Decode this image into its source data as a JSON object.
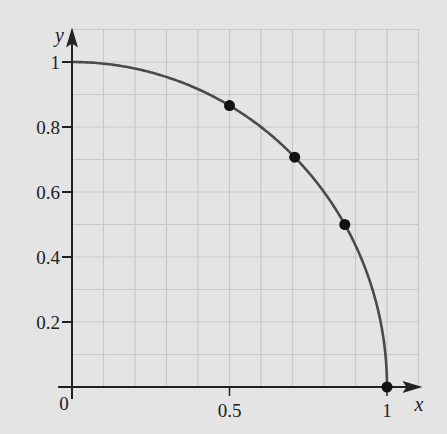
{
  "chart_data": {
    "type": "line",
    "title": "",
    "xlabel": "x",
    "ylabel": "y",
    "xlim": [
      0,
      1.1
    ],
    "ylim": [
      0,
      1.1
    ],
    "grid": true,
    "grid_step": 0.1,
    "x_ticks": [
      {
        "value": 0,
        "label": "0"
      },
      {
        "value": 0.5,
        "label": "0.5"
      },
      {
        "value": 1,
        "label": "1"
      }
    ],
    "y_ticks": [
      {
        "value": 0.2,
        "label": "0.2"
      },
      {
        "value": 0.4,
        "label": "0.4"
      },
      {
        "value": 0.6,
        "label": "0.6"
      },
      {
        "value": 0.8,
        "label": "0.8"
      },
      {
        "value": 1,
        "label": "1"
      }
    ],
    "series": [
      {
        "name": "quarter circle y = sqrt(1 - x^2)",
        "function": "sqrt(1-x^2)",
        "domain": [
          0,
          1
        ],
        "color": "#4a4a4a"
      }
    ],
    "points": [
      {
        "x": 0.5,
        "y": 0.866
      },
      {
        "x": 0.707,
        "y": 0.707
      },
      {
        "x": 0.866,
        "y": 0.5
      },
      {
        "x": 1,
        "y": 0
      }
    ]
  },
  "colors": {
    "background": "#e4e4e4",
    "grid": "#c8c8c8",
    "axis": "#222222",
    "curve": "#4a4a4a",
    "point": "#111111"
  }
}
